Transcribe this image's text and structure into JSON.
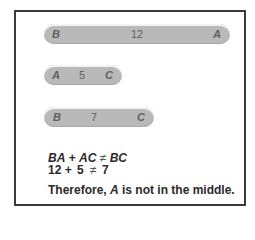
{
  "diagram": {
    "segments": [
      {
        "id": "BA",
        "left_label": "B",
        "length": "12",
        "right_label": "A"
      },
      {
        "id": "AC",
        "left_label": "A",
        "length": "5",
        "right_label": "C"
      },
      {
        "id": "BC",
        "left_label": "B",
        "length": "7",
        "right_label": "C"
      }
    ],
    "equation_symbolic": {
      "lhs1": "BA",
      "plus": "+",
      "lhs2": "AC",
      "neq": "≠",
      "rhs": "BC"
    },
    "equation_numeric": {
      "lhs1": "12",
      "plus": "+",
      "lhs2": "5",
      "neq": "≠",
      "rhs": "7"
    },
    "conclusion": {
      "prefix": "Therefore, ",
      "point": "A",
      "suffix": " is not in the middle."
    }
  },
  "colors": {
    "bar": "#b9b9b9",
    "frame": "#3a3a3a",
    "text": "#2a2a2a"
  }
}
